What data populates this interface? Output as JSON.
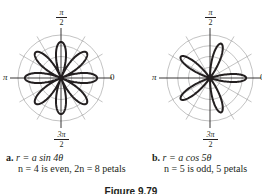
{
  "figure": {
    "caption": "Figure 9.79"
  },
  "colors": {
    "grid": "#9a9a9a",
    "axis": "#231f20",
    "curve": "#231f20"
  },
  "plots": [
    {
      "id": "a",
      "labels": {
        "top_num": "π",
        "top_den": "2",
        "left": "π",
        "right": "0",
        "bottom_num": "3π",
        "bottom_den": "2"
      },
      "caption": {
        "letter": "a.",
        "equation": "r = a sin 4θ",
        "note": "n = 4 is even, 2n = 8 petals"
      }
    },
    {
      "id": "b",
      "labels": {
        "top_num": "π",
        "top_den": "2",
        "left": "π",
        "right": "0",
        "bottom_num": "3π",
        "bottom_den": "2"
      },
      "caption": {
        "letter": "b.",
        "equation": "r = a cos 5θ",
        "note": "n = 5 is odd, 5 petals"
      }
    }
  ],
  "chart_data": [
    {
      "type": "line",
      "subtype": "polar rose",
      "title": "r = a sin 4θ",
      "equation": "r = a sin 4θ",
      "n": 4,
      "petals": 8,
      "petal_angles_deg": [
        0,
        45,
        90,
        135,
        180,
        225,
        270,
        315
      ],
      "angular_ticks": [
        "0",
        "π/2",
        "π",
        "3π/2"
      ],
      "radial_gridlines_deg_step": 30,
      "concentric_circles": 4,
      "petal_length_fraction_of_grid": 0.84,
      "grid": true
    },
    {
      "type": "line",
      "subtype": "polar rose",
      "title": "r = a cos 5θ",
      "equation": "r = a cos 5θ",
      "n": 5,
      "petals": 5,
      "petal_angles_deg": [
        0,
        72,
        144,
        216,
        288
      ],
      "angular_ticks": [
        "0",
        "π/2",
        "π",
        "3π/2"
      ],
      "radial_gridlines_deg_step": 30,
      "concentric_circles": 4,
      "petal_length_fraction_of_grid": 0.84,
      "grid": true
    }
  ]
}
